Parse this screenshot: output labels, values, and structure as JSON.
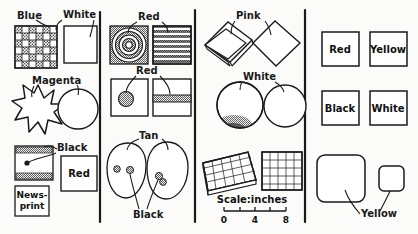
{
  "figure": {
    "background_color": "#fbfbfa",
    "ink_color": "#1a1a1a",
    "panel_count": 4
  },
  "panel1": {
    "name": "panel-1",
    "label_blue": "Blue",
    "label_white": "White",
    "label_magenta": "Magenta",
    "label_black": "Black",
    "label_newsprint_line1": "News-",
    "label_newsprint_line2": "print",
    "label_red": "Red"
  },
  "panel2": {
    "name": "panel-2",
    "label_red_top": "Red",
    "label_red_mid": "Red",
    "label_tan": "Tan",
    "label_black": "Black"
  },
  "panel3": {
    "name": "panel-3",
    "label_pink": "Pink",
    "label_white": "White",
    "scale_caption": "Scale:inches",
    "scale_ticks": [
      "0",
      "4",
      "8"
    ]
  },
  "panel4": {
    "name": "panel-4",
    "swatch_red": "Red",
    "swatch_yellow": "Yellow",
    "swatch_black": "Black",
    "swatch_white": "White",
    "label_yellow": "Yellow"
  }
}
